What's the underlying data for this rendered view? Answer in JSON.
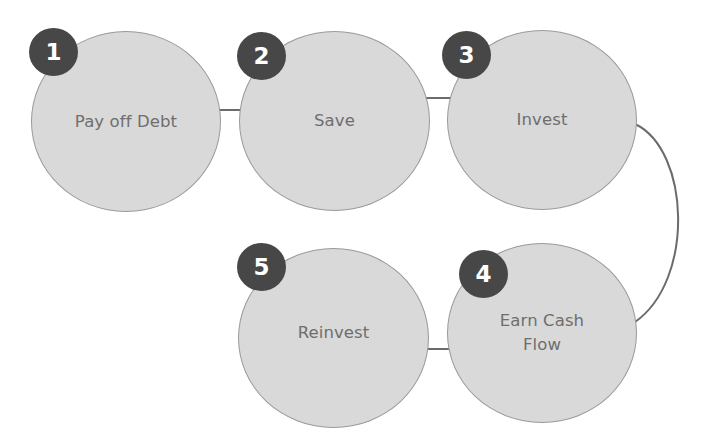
{
  "colors": {
    "circle_fill": "#d9d9d9",
    "circle_border": "#9a9a9a",
    "badge_fill": "#474747",
    "badge_text": "#ffffff",
    "label_text": "#6e6e6e",
    "connector": "#6b6b6b"
  },
  "steps": [
    {
      "number": "1",
      "label": "Pay off Debt"
    },
    {
      "number": "2",
      "label": "Save"
    },
    {
      "number": "3",
      "label": "Invest"
    },
    {
      "number": "4",
      "label": "Earn Cash Flow"
    },
    {
      "number": "5",
      "label": "Reinvest"
    }
  ]
}
